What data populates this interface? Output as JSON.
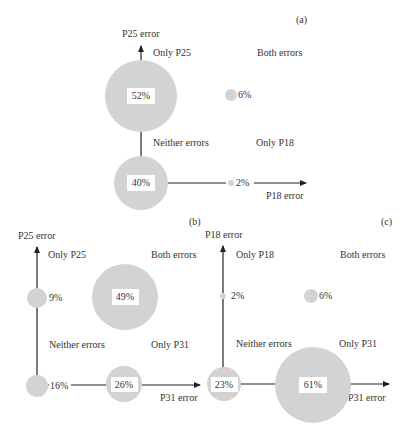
{
  "colors": {
    "bubble": "#d3d3d3",
    "axis": "#222222",
    "label_box": "#ffffff",
    "text": "#333333"
  },
  "panels": [
    {
      "id": "a",
      "label": "(a)",
      "y_axis_label": "P25 error",
      "x_axis_label": "P18 error",
      "quadrants": {
        "top_left": "Only P25",
        "top_right": "Both errors",
        "bottom_left": "Neither errors",
        "bottom_right": "Only P18"
      },
      "values": {
        "only_y": "52%",
        "both": "6%",
        "neither": "40%",
        "only_x": "2%"
      }
    },
    {
      "id": "b",
      "label": "(b)",
      "y_axis_label": "P25 error",
      "x_axis_label": "P31 error",
      "quadrants": {
        "top_left": "Only P25",
        "top_right": "Both errors",
        "bottom_left": "Neither errors",
        "bottom_right": "Only P31"
      },
      "values": {
        "only_y": "9%",
        "both": "49%",
        "neither": "16%",
        "only_x": "26%"
      }
    },
    {
      "id": "c",
      "label": "(c)",
      "y_axis_label": "P18 error",
      "x_axis_label": "P31 error",
      "quadrants": {
        "top_left": "Only P18",
        "top_right": "Both errors",
        "bottom_left": "Neither errors",
        "bottom_right": "Only P31"
      },
      "values": {
        "only_y": "2%",
        "both": "6%",
        "neither": "23%",
        "only_x": "61%"
      }
    }
  ]
}
